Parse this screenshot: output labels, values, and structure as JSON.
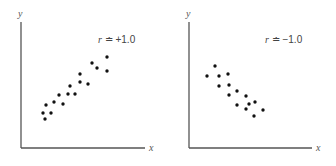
{
  "chart_data": [
    {
      "type": "scatter",
      "title": "",
      "xlabel": "x",
      "ylabel": "y",
      "annotation": "r ≐ +1.0",
      "annotation_symbol": "r",
      "annotation_value": "≐ +1.0",
      "grid": false,
      "legend": null,
      "xlim": [
        0,
        124
      ],
      "ylim": [
        0,
        126
      ],
      "points": [
        [
          86,
          91
        ],
        [
          71,
          85
        ],
        [
          76,
          80
        ],
        [
          86,
          77
        ],
        [
          59,
          74
        ],
        [
          59,
          66
        ],
        [
          67,
          64
        ],
        [
          49,
          62
        ],
        [
          47,
          54
        ],
        [
          54,
          54
        ],
        [
          38,
          53
        ],
        [
          25,
          43
        ],
        [
          33,
          46
        ],
        [
          42,
          44
        ],
        [
          22,
          35
        ],
        [
          30,
          35
        ],
        [
          24,
          29
        ]
      ]
    },
    {
      "type": "scatter",
      "title": "",
      "xlabel": "x",
      "ylabel": "y",
      "annotation": "r ≐ −1.0",
      "annotation_symbol": "r",
      "annotation_value": "≐ −1.0",
      "grid": false,
      "legend": null,
      "xlim": [
        0,
        123
      ],
      "ylim": [
        0,
        126
      ],
      "points": [
        [
          26,
          82
        ],
        [
          18,
          72
        ],
        [
          30,
          72
        ],
        [
          39,
          74
        ],
        [
          30,
          62
        ],
        [
          40,
          63
        ],
        [
          48,
          57
        ],
        [
          40,
          53
        ],
        [
          57,
          52
        ],
        [
          48,
          43
        ],
        [
          60,
          44
        ],
        [
          66,
          46
        ],
        [
          57,
          39
        ],
        [
          74,
          38
        ],
        [
          65,
          32
        ]
      ]
    }
  ],
  "style": {
    "axis_color": "#555555",
    "point_color": "#111111"
  }
}
